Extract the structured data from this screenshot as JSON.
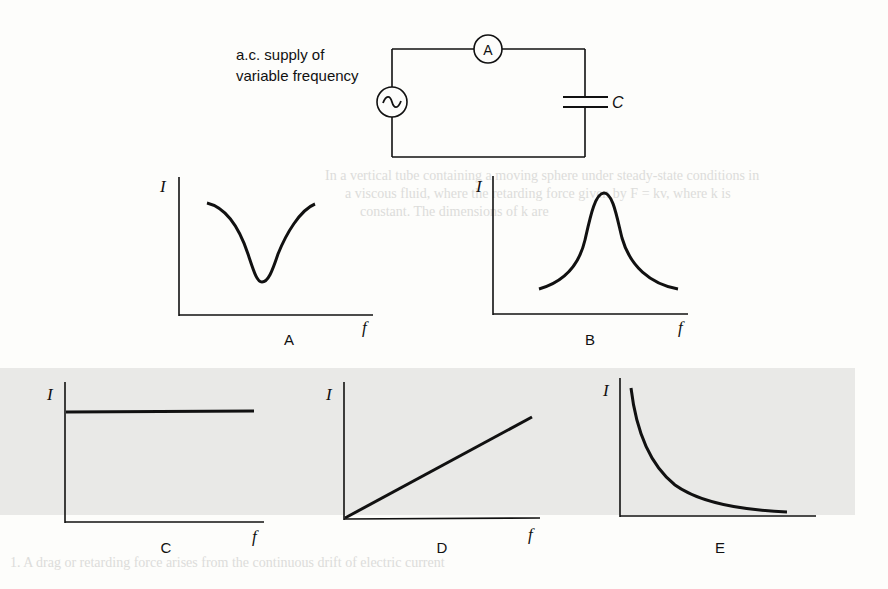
{
  "circuit": {
    "supply_label_line1": "a.c. supply of",
    "supply_label_line2": "variable frequency",
    "ammeter_symbol": "A",
    "capacitor_label": "C",
    "source_icon": "ac-source-icon"
  },
  "graphs": [
    {
      "id": "A",
      "caption": "A",
      "y_axis": "I",
      "x_axis": "f",
      "shape": "dip (minimum at mid frequency)"
    },
    {
      "id": "B",
      "caption": "B",
      "y_axis": "I",
      "x_axis": "f",
      "shape": "peak (resonance maximum)"
    },
    {
      "id": "C",
      "caption": "C",
      "y_axis": "I",
      "x_axis": "f",
      "shape": "constant horizontal line"
    },
    {
      "id": "D",
      "caption": "D",
      "y_axis": "I",
      "x_axis": "f",
      "shape": "straight line through origin"
    },
    {
      "id": "E",
      "caption": "E",
      "y_axis": "I",
      "x_axis": "f",
      "shape": "decreasing hyperbolic curve"
    }
  ],
  "ghost_text": {
    "line1": "In a vertical tube containing a moving sphere under steady-state conditions in",
    "line2": "a viscous fluid, where the retarding force given by F = kv, where k is",
    "line3": "constant. The dimensions of k are",
    "bottom": "1.  A drag or retarding force arises from the continuous drift of electric current"
  }
}
